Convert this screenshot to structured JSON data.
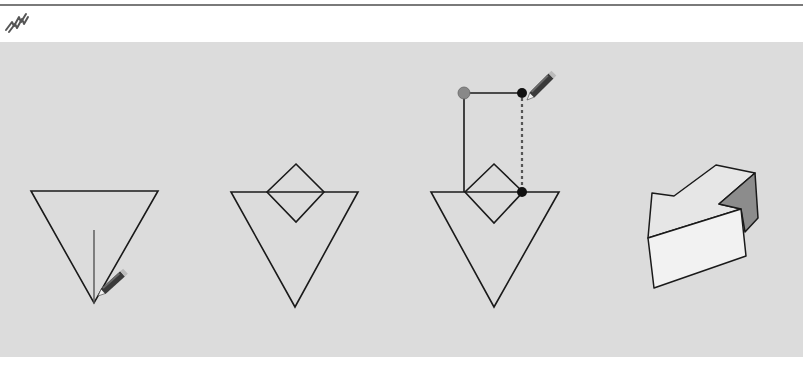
{
  "toolbar": {
    "active_tool_icon": "freehand-pencil-icon"
  },
  "canvas": {
    "background": "#dcdcdc",
    "line_color": "#1a1a1a",
    "steps": [
      {
        "label": "Step 1: Draw line from triangle apex",
        "cursor": "pencil-icon"
      },
      {
        "label": "Step 2: Diamond drawn on triangle edge"
      },
      {
        "label": "Step 3: Rectangle drawn with inference guide",
        "cursor": "pencil-icon",
        "inference_point_color": "#888888",
        "endpoint_color": "#111111"
      },
      {
        "label": "Step 4: Resulting 3D extruded shape",
        "face_light": "#f2f2f2",
        "face_dark": "#8c8c8c"
      }
    ]
  }
}
